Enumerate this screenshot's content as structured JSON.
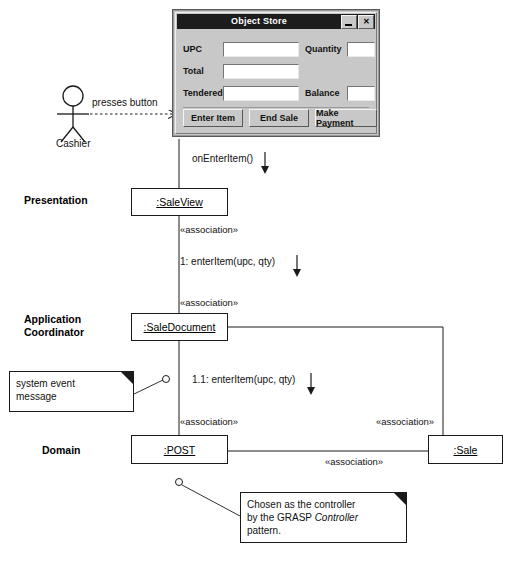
{
  "window": {
    "title": "Object Store",
    "controls": [
      {
        "name": "minimize",
        "glyph": ""
      },
      {
        "name": "close",
        "glyph": "✕"
      }
    ],
    "fields": [
      {
        "label": "UPC",
        "value": "",
        "placeholder": ""
      },
      {
        "label": "Quantity",
        "value": "",
        "placeholder": ""
      },
      {
        "label": "Total",
        "value": "",
        "placeholder": ""
      },
      {
        "label": "Tendered",
        "value": "",
        "placeholder": ""
      },
      {
        "label": "Balance",
        "value": "",
        "placeholder": ""
      }
    ],
    "buttons": [
      {
        "label": "Enter Item"
      },
      {
        "label": "End Sale"
      },
      {
        "label": "Make Payment"
      }
    ]
  },
  "actor": {
    "name": "Cashier",
    "action_label": "presses button"
  },
  "layers": [
    {
      "label": "Presentation"
    },
    {
      "label": "Application\nCoordinator"
    },
    {
      "label_line1": "Application",
      "label_line2": "Coordinator"
    },
    {
      "label": "Domain"
    }
  ],
  "layer_presentation": "Presentation",
  "layer_appcoord_line1": "Application",
  "layer_appcoord_line2": "Coordinator",
  "layer_domain": "Domain",
  "objects": [
    {
      "name": ":SaleView",
      "layer": "Presentation"
    },
    {
      "name": ":SaleDocument",
      "layer": "Application Coordinator"
    },
    {
      "name": ":POST",
      "layer": "Domain"
    },
    {
      "name": ":Sale",
      "layer": "Domain"
    }
  ],
  "box_saleview": ":SaleView",
  "box_saledocument": ":SaleDocument",
  "box_post": ":POST",
  "box_sale": ":Sale",
  "messages": [
    {
      "id": "",
      "text": "onEnterItem()",
      "from": "Cashier UI",
      "to": ":SaleView"
    },
    {
      "id": "1",
      "text": "1: enterItem(upc, qty)",
      "from": ":SaleView",
      "to": ":SaleDocument"
    },
    {
      "id": "1.1",
      "text": "1.1: enterItem(upc, qty)",
      "from": ":SaleDocument",
      "to": ":POST"
    }
  ],
  "msg_onenteritem": "onEnterItem()",
  "msg_enteritem_1": "1: enterItem(upc, qty)",
  "msg_enteritem_11": "1.1: enterItem(upc, qty)",
  "stereotypes": {
    "saleview_to_saledocument": "«association»",
    "saleview_below": "«association»",
    "saledocument_to_post": "«association»",
    "sale_vertical": "«association»",
    "post_to_sale": "«association»",
    "label": "«association»"
  },
  "notes": [
    {
      "id": "system-event-note",
      "lines": [
        "system event",
        "message"
      ]
    },
    {
      "id": "grasp-note",
      "lines": [
        "Chosen as the controller",
        "by the GRASP ",
        "pattern."
      ],
      "emphasis": "Controller"
    }
  ],
  "note_sysevent_line1": "system event",
  "note_sysevent_line2": "message",
  "note_grasp_part1": "Chosen as the controller",
  "note_grasp_part2": "by the GRASP ",
  "note_grasp_emph": "Controller",
  "note_grasp_part3": "pattern.",
  "colors": {
    "background": "#ffffff",
    "line": "#1a1a1a",
    "window_face": "#c8c8c8",
    "titlebar": "#1c1c1c",
    "titlebar_text": "#ffffff",
    "field_bg": "#ffffff"
  }
}
